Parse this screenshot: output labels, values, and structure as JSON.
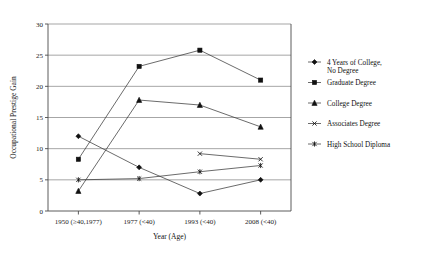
{
  "chart_data": {
    "type": "line",
    "title": "",
    "xlabel": "Year (Age)",
    "ylabel": "Occupational Prestige Gain",
    "categories": [
      "1950 (≥40,1977)",
      "1977 (<40)",
      "1993 (<40)",
      "2008 (<40)"
    ],
    "ylim": [
      0,
      30
    ],
    "yticks": [
      0,
      5,
      10,
      15,
      20,
      25,
      30
    ],
    "grid": true,
    "legend_position": "right",
    "series": [
      {
        "name": "4 Years of College, No Degree",
        "marker": "diamond",
        "values": [
          12.0,
          7.0,
          2.8,
          5.0
        ]
      },
      {
        "name": "Graduate Degree",
        "marker": "square",
        "values": [
          8.3,
          23.2,
          25.8,
          21.0
        ]
      },
      {
        "name": "College Degree",
        "marker": "triangle",
        "values": [
          3.2,
          17.8,
          17.0,
          13.5
        ]
      },
      {
        "name": "Associates Degree",
        "marker": "x",
        "values": [
          null,
          null,
          9.2,
          8.3
        ]
      },
      {
        "name": "High School Diploma",
        "marker": "asterisk",
        "values": [
          5.0,
          5.2,
          6.3,
          7.3
        ]
      }
    ]
  },
  "axis": {
    "ytick_labels": [
      "0",
      "5",
      "10",
      "15",
      "20",
      "25",
      "30"
    ],
    "xtick_labels": [
      "1950 (≥40,1977)",
      "1977 (<40)",
      "1993 (<40)",
      "2008 (<40)"
    ],
    "y_title": "Occupational Prestige Gain",
    "x_title": "Year (Age)"
  },
  "legend": {
    "items": [
      {
        "label_line1": "4 Years of College,",
        "label_line2": "No Degree",
        "marker": "diamond"
      },
      {
        "label_line1": "Graduate Degree",
        "label_line2": "",
        "marker": "square"
      },
      {
        "label_line1": "College Degree",
        "label_line2": "",
        "marker": "triangle"
      },
      {
        "label_line1": "Associates Degree",
        "label_line2": "",
        "marker": "x"
      },
      {
        "label_line1": "High School Diploma",
        "label_line2": "",
        "marker": "asterisk"
      }
    ]
  },
  "colors": {
    "line": "#3a3a3a",
    "grid": "#808080",
    "axis": "#4a4a4a",
    "text": "#111111",
    "background": "#ffffff"
  }
}
